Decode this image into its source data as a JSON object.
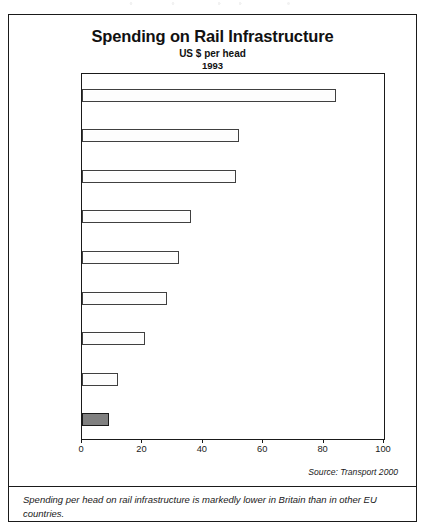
{
  "chart_data": {
    "type": "bar",
    "orientation": "horizontal",
    "title": "Spending on Rail Infrastructure",
    "subtitle": "US $ per head",
    "subtitle2": "1993",
    "xlabel": "",
    "ylabel": "",
    "categories": [
      "Sweden",
      "France",
      "Netherlands",
      "Belgium",
      "Germany",
      "Italy",
      "Portugal",
      "Spain",
      "Britain"
    ],
    "values": [
      84,
      52,
      51,
      36,
      32,
      28,
      21,
      12,
      9
    ],
    "xlim": [
      0,
      100
    ],
    "xticks": [
      0,
      20,
      40,
      60,
      80,
      100
    ],
    "xtick_labels": [
      "0",
      "20",
      "40",
      "60",
      "80",
      "100"
    ],
    "grid": false,
    "legend": false,
    "highlight_category": "Britain",
    "colors": {
      "bar_fill": "#fdfdfd",
      "bar_stroke": "#404040",
      "highlight_fill": "#808080",
      "highlight_stroke": "#1a1a1a",
      "frame": "#1a1a1a",
      "text": "#1a1a1a"
    },
    "source": "Source: Transport 2000",
    "caption": "Spending per head on rail infrastructure is markedly lower in Britain than in other EU countries."
  }
}
